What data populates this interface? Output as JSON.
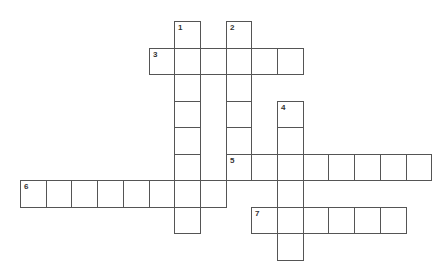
{
  "puzzle": {
    "type": "crossword",
    "cell_size": 25.7,
    "row_height": 26.5,
    "origin": {
      "x": 20,
      "y": 21
    },
    "colors": {
      "border": "#555555",
      "cell_bg": "#ffffff",
      "number": "#333333"
    },
    "clues": [
      {
        "number": "1",
        "direction": "down",
        "row": 0,
        "col": 6,
        "length": 8
      },
      {
        "number": "2",
        "direction": "down",
        "row": 0,
        "col": 8,
        "length": 6
      },
      {
        "number": "3",
        "direction": "across",
        "row": 1,
        "col": 5,
        "length": 6
      },
      {
        "number": "4",
        "direction": "down",
        "row": 3,
        "col": 10,
        "length": 6
      },
      {
        "number": "5",
        "direction": "across",
        "row": 5,
        "col": 8,
        "length": 8
      },
      {
        "number": "6",
        "direction": "across",
        "row": 6,
        "col": 0,
        "length": 8
      },
      {
        "number": "7",
        "direction": "across",
        "row": 7,
        "col": 9,
        "length": 6
      }
    ]
  }
}
